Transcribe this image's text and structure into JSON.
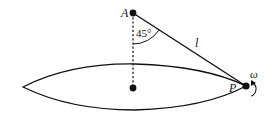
{
  "figure": {
    "type": "conical-pendulum",
    "labels": {
      "pivot": "A",
      "bob": "P",
      "length": "l",
      "angle": "45°",
      "angular_velocity": "ω"
    },
    "colors": {
      "stroke": "#111111",
      "background": "#ffffff"
    }
  }
}
